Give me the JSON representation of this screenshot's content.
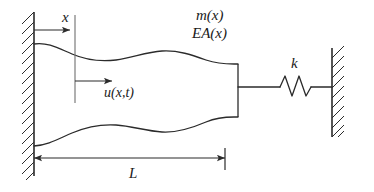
{
  "figure": {
    "background_color": "#ffffff",
    "line_color": "#2b2b2b",
    "text_color": "#1a1a1a"
  },
  "labels": {
    "coordinate_x": "x",
    "mass_per_length": "m(x)",
    "axial_rigidity": "EA(x)",
    "displacement": "u(x,t)",
    "spring_constant": "k",
    "length": "L"
  },
  "elements": {
    "left_wall": "fixed-support-hatched-wall",
    "right_wall": "fixed-support-hatched-wall",
    "bar": "variable-cross-section-bar",
    "spring": "coil-spring",
    "x_arrow": "coordinate-arrow",
    "u_arrow": "displacement-arrow",
    "section_line": "section-reference-line",
    "dimension_line": "length-dimension-line"
  },
  "geometry": {
    "width": 374,
    "height": 192,
    "left_wall_x": 34,
    "right_wall_x": 332,
    "bar_right_x": 238,
    "section_x": 75,
    "axis_y": 30,
    "spring_y": 87,
    "dimension_y": 158,
    "spring_peaks": 3
  }
}
